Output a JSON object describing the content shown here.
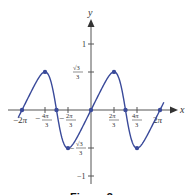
{
  "chart_data": {
    "type": "line",
    "function": "y = sin(x) / (2 + cos(x))",
    "title": "",
    "caption": "Figure 3",
    "xlabel": "x",
    "ylabel": "y",
    "xlim": [
      -6.9,
      6.9
    ],
    "ylim": [
      -1.15,
      1.4
    ],
    "x_ticks": [
      {
        "value": -6.2832,
        "label": "−2π"
      },
      {
        "value": -4.1888,
        "label": "−4π/3"
      },
      {
        "value": -2.0944,
        "label": "−2π/3"
      },
      {
        "value": 2.0944,
        "label": "2π/3"
      },
      {
        "value": 4.1888,
        "label": "4π/3"
      },
      {
        "value": 6.2832,
        "label": "2π"
      }
    ],
    "y_ticks": [
      {
        "value": 1,
        "label": "1"
      },
      {
        "value": 0.5774,
        "label": "√3/3"
      },
      {
        "value": -0.5774,
        "label": "−√3/3"
      },
      {
        "value": -1,
        "label": "−1"
      }
    ],
    "marked_points": [
      {
        "x": -6.2832,
        "y": 0
      },
      {
        "x": -4.1888,
        "y": 0.5774
      },
      {
        "x": -3.1416,
        "y": 0
      },
      {
        "x": -2.0944,
        "y": -0.5774
      },
      {
        "x": 0,
        "y": 0
      },
      {
        "x": 2.0944,
        "y": 0.5774
      },
      {
        "x": 3.1416,
        "y": 0
      },
      {
        "x": 4.1888,
        "y": -0.5774
      },
      {
        "x": 6.2832,
        "y": 0
      }
    ],
    "colors": {
      "curve": "#3a4a9a",
      "axis": "#444444"
    },
    "grid": false
  }
}
